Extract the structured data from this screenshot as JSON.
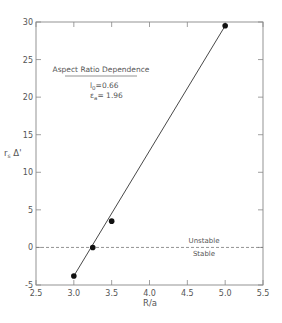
{
  "chart_data": {
    "type": "scatter",
    "title": "",
    "xlabel": "R/a",
    "ylabel": "r_s Δ'",
    "xlim": [
      2.5,
      5.5
    ],
    "ylim": [
      -5,
      30
    ],
    "xticks": [
      2.5,
      3.0,
      3.5,
      4.0,
      4.5,
      5.0,
      5.5
    ],
    "xtick_labels": [
      "2.5",
      "3.0",
      "3.5",
      "4.0",
      "4.5",
      "5.0",
      "5.5"
    ],
    "yticks": [
      -5,
      0,
      5,
      10,
      15,
      20,
      25,
      30
    ],
    "ytick_labels": [
      "-5",
      "0",
      "5",
      "10",
      "15",
      "20",
      "25",
      "30"
    ],
    "grid": false,
    "series": [
      {
        "name": "data",
        "marker": "filled-circle",
        "x": [
          3.0,
          3.25,
          3.5,
          5.0
        ],
        "y": [
          -3.8,
          0.0,
          3.5,
          29.5
        ]
      },
      {
        "name": "fit",
        "style": "solid-line",
        "x": [
          3.0,
          5.0
        ],
        "y": [
          -3.8,
          29.5
        ]
      },
      {
        "name": "stability boundary",
        "style": "dashed-line",
        "x": [
          2.5,
          5.5
        ],
        "y": [
          0,
          0
        ]
      }
    ],
    "annotations": {
      "box_title": "Aspect Ratio Dependence",
      "line1_symbol": "l",
      "line1_sub": "0",
      "line1_value": "=0.66",
      "line2_symbol": "ε",
      "line2_sub": "a",
      "line2_value": "= 1.96",
      "unstable_label": "Unstable",
      "stable_label": "Stable"
    }
  },
  "colors": {
    "axis": "#888888",
    "text": "#555555",
    "marker": "#111111",
    "line": "#333333",
    "dashed": "#777777"
  }
}
